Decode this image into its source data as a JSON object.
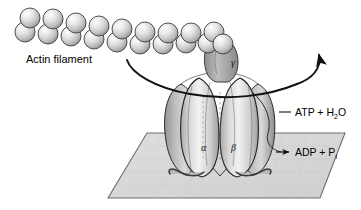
{
  "figure": {
    "title_visible": false,
    "background_color": "#ffffff"
  },
  "labels": {
    "actin_filament": "Actin filament",
    "gamma": "γ",
    "alpha": "α",
    "beta": "β",
    "atp_main": "ATP + H",
    "atp_sub": "2",
    "atp_tail": "O",
    "adp_main": "ADP + P",
    "adp_sub": "i"
  },
  "colors": {
    "outline": "#1a1a1a",
    "sphere_light": "#ffffff",
    "sphere_mid": "#d8d8d8",
    "sphere_dark": "#8e8e8e",
    "lobe_light": "#f0f0f0",
    "lobe_mid": "#c6c6c6",
    "lobe_dark": "#9a9a9a",
    "stalk": "#a8a8a8",
    "membrane_fill": "#d5d5d5",
    "membrane_edge": "#6e6e6e",
    "text": "#000000"
  },
  "membrane": {
    "shape": "parallelogram",
    "corners": [
      [
        147,
        133
      ],
      [
        345,
        133
      ],
      [
        320,
        198
      ],
      [
        108,
        198
      ]
    ]
  },
  "actin_filament": {
    "strand_upper_beads": 9,
    "strand_lower_beads": 9,
    "direction": "upper-left to lower-right",
    "bead_radius_px": 10
  },
  "arrows": {
    "rotation_arrow_label": "rotation",
    "adp_arrow_label": "product release"
  }
}
